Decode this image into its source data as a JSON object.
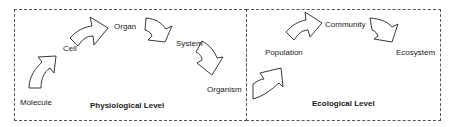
{
  "diagram": {
    "sections": [
      {
        "title": "Physiological Level",
        "nodes": [
          "Molecule",
          "Cell",
          "Organ",
          "System",
          "Organism"
        ]
      },
      {
        "title": "Ecological Level",
        "nodes": [
          "Population",
          "Community",
          "Ecosystem"
        ]
      }
    ],
    "flow": "Molecule → Cell → Organ → System → Organism → Population → Community → Ecosystem",
    "colors": {
      "stroke": "#222222",
      "border": "#555555",
      "background": "#ffffff"
    }
  }
}
